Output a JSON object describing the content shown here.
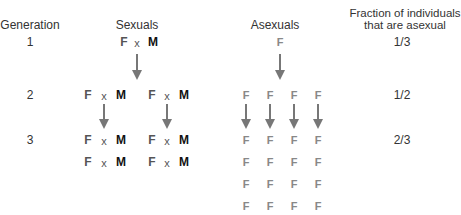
{
  "headers": {
    "generation": "Generation",
    "sexuals": "Sexuals",
    "asexuals": "Asexuals",
    "fraction_line1": "Fraction of individuals",
    "fraction_line2": "that are asexual"
  },
  "generations": [
    {
      "label": "1",
      "fraction": "1/3",
      "sexual_pairs": 1,
      "asexual_count": 1
    },
    {
      "label": "2",
      "fraction": "1/2",
      "sexual_pairs": 2,
      "asexual_count": 4
    },
    {
      "label": "3",
      "fraction": "2/3",
      "sexual_pairs": 4,
      "asexual_count": 16
    }
  ],
  "symbols": {
    "female": "F",
    "male": "M",
    "cross": "x"
  },
  "colors": {
    "text": "#333333",
    "male": "#111111",
    "female_sexual": "#555555",
    "female_asexual": "#888888",
    "arrow": "#777777"
  }
}
